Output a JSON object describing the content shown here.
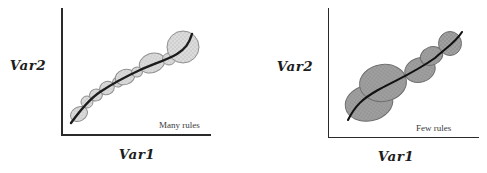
{
  "figure": {
    "background": "#ffffff",
    "axis_color": "#2a2a2a"
  },
  "chart_data": [
    {
      "type": "bubble",
      "title": "",
      "xlabel": "Var1",
      "ylabel": "Var2",
      "annotation": "Many rules",
      "axes": {
        "ticks": false,
        "gridlines": false,
        "scale_labels": "none (conceptual diagram)"
      },
      "description": "Many small overlapping clusters (rules) covering an increasing S-shaped trend curve",
      "colors": {
        "bubble_fill": "#dcdcdc",
        "bubble_dot": "#c2c2c2",
        "bubble_stroke": "#8f8f8f",
        "curve": "#1c1c1c"
      },
      "curve_width": 2.4,
      "curve_path": "M71,123 C79,112 88,100 100,92 C115,82 127,76 140,70 C153,64 167,60 177,54 C185,49 189,44 192,34",
      "bubbles": [
        {
          "cx": 79,
          "cy": 114,
          "rx": 9,
          "ry": 7,
          "rot": -32
        },
        {
          "cx": 87,
          "cy": 102,
          "rx": 6,
          "ry": 6,
          "rot": 0
        },
        {
          "cx": 96,
          "cy": 95,
          "rx": 6.5,
          "ry": 6,
          "rot": -20
        },
        {
          "cx": 107,
          "cy": 88,
          "rx": 7.5,
          "ry": 6.5,
          "rot": -25
        },
        {
          "cx": 118,
          "cy": 82,
          "rx": 5.5,
          "ry": 5,
          "rot": -20
        },
        {
          "cx": 125,
          "cy": 77,
          "rx": 10,
          "ry": 7.5,
          "rot": -18
        },
        {
          "cx": 137,
          "cy": 72,
          "rx": 5.5,
          "ry": 5,
          "rot": -15
        },
        {
          "cx": 152,
          "cy": 63,
          "rx": 13,
          "ry": 9.5,
          "rot": -20
        },
        {
          "cx": 169,
          "cy": 59,
          "rx": 6.5,
          "ry": 6,
          "rot": 0
        },
        {
          "cx": 183,
          "cy": 47,
          "rx": 16,
          "ry": 16,
          "rot": 0
        }
      ]
    },
    {
      "type": "bubble",
      "title": "",
      "xlabel": "Var1",
      "ylabel": "Var2",
      "annotation": "Few rules",
      "axes": {
        "ticks": false,
        "gridlines": false,
        "scale_labels": "none (conceptual diagram)"
      },
      "description": "Few large overlapping clusters (rules) covering the same increasing S-shaped trend curve",
      "colors": {
        "bubble_fill": "#a0a0a0",
        "bubble_dot": "#8a8a8a",
        "bubble_stroke": "#6f6f6f",
        "curve": "#111111"
      },
      "curve_width": 2.1,
      "curve_path": "M348,120 C355,106 362,99 378,90 C398,79 412,74 435,58 C447,47 455,43 462,32",
      "bubbles": [
        {
          "cx": 369,
          "cy": 103,
          "rx": 24,
          "ry": 18,
          "rot": -12
        },
        {
          "cx": 383,
          "cy": 83,
          "rx": 23.5,
          "ry": 18.5,
          "rot": -8
        },
        {
          "cx": 420,
          "cy": 70,
          "rx": 15.5,
          "ry": 12,
          "rot": -18
        },
        {
          "cx": 431.5,
          "cy": 56,
          "rx": 11.5,
          "ry": 9,
          "rot": -22
        },
        {
          "cx": 450,
          "cy": 43.5,
          "rx": 11.5,
          "ry": 12,
          "rot": 0
        }
      ]
    }
  ]
}
